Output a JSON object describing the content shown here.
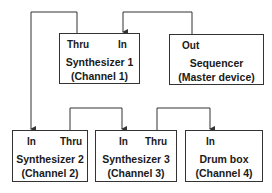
{
  "diagram": {
    "devices": [
      {
        "id": "synth1",
        "name": "Synthesizer 1",
        "channel": "(Channel 1)",
        "ports": {
          "thru": "Thru",
          "in": "In"
        }
      },
      {
        "id": "sequencer",
        "name": "Sequencer",
        "channel": "(Master device)",
        "ports": {
          "out": "Out"
        }
      },
      {
        "id": "synth2",
        "name": "Synthesizer 2",
        "channel": "(Channel 2)",
        "ports": {
          "in": "In",
          "thru": "Thru"
        }
      },
      {
        "id": "synth3",
        "name": "Synthesizer 3",
        "channel": "(Channel 3)",
        "ports": {
          "in": "In",
          "thru": "Thru"
        }
      },
      {
        "id": "drum",
        "name": "Drum box",
        "channel": "(Channel 4)",
        "ports": {
          "in": "In"
        }
      }
    ],
    "connections": [
      {
        "from": "Sequencer Out",
        "to": "Synthesizer 1 In"
      },
      {
        "from": "Synthesizer 1 Thru",
        "to": "Synthesizer 2 In"
      },
      {
        "from": "Synthesizer 2 Thru",
        "to": "Synthesizer 3 In"
      },
      {
        "from": "Synthesizer 3 Thru",
        "to": "Drum box In"
      }
    ]
  }
}
